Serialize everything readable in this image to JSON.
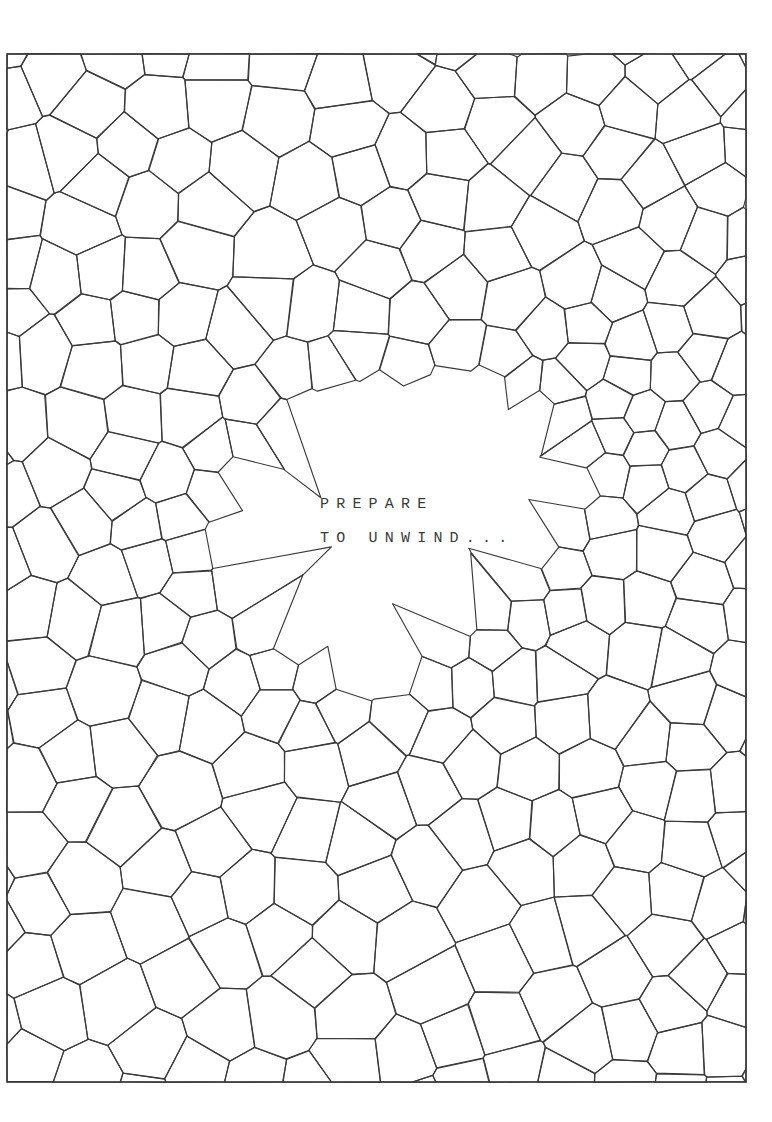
{
  "page": {
    "title": "Prepare To Unwind",
    "background_color": "#ffffff",
    "width": 772,
    "height": 1122
  },
  "frame": {
    "name": "artwork-border",
    "x": 7,
    "y": 54,
    "width": 739,
    "height": 1028,
    "stroke_color": "#3a3a3a",
    "stroke_width": 1.6
  },
  "artwork": {
    "style": "voronoi-mosaic",
    "description": "Hand-drawn style cellular mosaic filling the framed page",
    "line_color": "#3a3a3a",
    "line_width": 1.15,
    "fill_color": "#ffffff",
    "cell_count_approx": 300,
    "negative_space": {
      "shape": "organic-blob",
      "center_x": 392,
      "center_y": 520,
      "radius_x": 158,
      "radius_y": 128
    },
    "seed": 20240917
  },
  "caption": {
    "name": "prepare-to-unwind-caption",
    "lines": [
      "PREPARE",
      "TO UNWIND..."
    ],
    "color": "#3a3a3a",
    "font_size_px": 15,
    "letter_spacing_px": 7.2,
    "x": 320,
    "y": 488
  }
}
